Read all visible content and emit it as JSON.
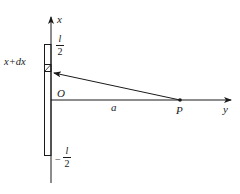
{
  "diagram": {
    "colors": {
      "line": "#1a1a1a",
      "background": "#ffffff"
    },
    "axes": {
      "vertical_label": "x",
      "horizontal_label": "y",
      "origin_label": "O"
    },
    "rod": {
      "top_label_num": "l",
      "top_label_den": "2",
      "bottom_label_sign": "−",
      "bottom_label_num": "l",
      "bottom_label_den": "2"
    },
    "element": {
      "label": "x+dx"
    },
    "distance": {
      "label": "a"
    },
    "point": {
      "label": "P"
    }
  }
}
